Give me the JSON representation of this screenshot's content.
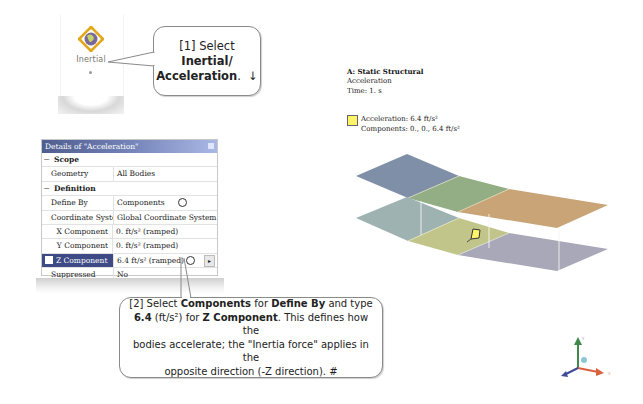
{
  "ribbon": {
    "inertial_button": {
      "label": "Inertial",
      "icon": "inertial-globe-icon",
      "dropdown_icon": "dropdown-dot-icon"
    }
  },
  "callout1": {
    "line1": "[1] Select",
    "line2": "Inertial/",
    "line3": "Acceleration",
    "line3_suffix": ".",
    "arrow": "↓"
  },
  "details": {
    "title": "Details of \"Acceleration\"",
    "groups": [
      {
        "name": "Scope",
        "expanded": true,
        "rows": [
          {
            "key": "Geometry",
            "value": "All Bodies"
          }
        ]
      },
      {
        "name": "Definition",
        "expanded": true,
        "rows": [
          {
            "key": "Define By",
            "value": "Components"
          },
          {
            "key": "Coordinate System",
            "value": "Global Coordinate System"
          },
          {
            "key": "X Component",
            "value": "0. ft/s²  (ramped)"
          },
          {
            "key": "Y Component",
            "value": "0. ft/s²  (ramped)"
          },
          {
            "key": "Z Component",
            "value": "6.4 ft/s²  (ramped)",
            "selected": true
          },
          {
            "key": "Suppressed",
            "value": "No"
          }
        ]
      }
    ],
    "expand_symbol": "−",
    "flyout_arrow": "▸"
  },
  "callout2": {
    "t1": "[2] Select ",
    "b1": "Components",
    "t2": " for ",
    "b2": "Define By",
    "t3": " and type",
    "b3": "6.4",
    "t4": " (ft/s²) for ",
    "b4": "Z Component",
    "t5": ". This defines how the",
    "line3": "bodies accelerate; the \"Inertia force\" applies in the",
    "line4": "opposite direction (-Z direction). #"
  },
  "viewport": {
    "title": "A: Static Structural",
    "subtitle": "Acceleration",
    "time": "Time: 1. s",
    "legend": {
      "color": "#fff36a",
      "line1": "Acceleration: 6.4 ft/s²",
      "line2": "Components: 0., 0., 6.4 ft/s²"
    },
    "plane_colors": {
      "top": [
        "#7f8fa8",
        "#93ad84",
        "#c9a477"
      ],
      "bottom": [
        "#9fb2b2",
        "#c1c58a",
        "#a8a8b8"
      ]
    },
    "triad": {
      "x_color": "#d9603c",
      "y_color": "#3f8a4a",
      "z_color": "#3f4a9a",
      "x_label": "X",
      "y_label": "Y",
      "z_label": "Z"
    }
  }
}
